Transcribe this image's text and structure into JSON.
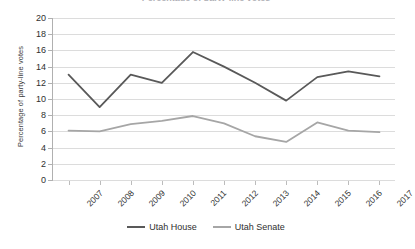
{
  "chart_data": {
    "type": "line",
    "title": "",
    "xlabel": "",
    "ylabel": "Percentage of party-line votes",
    "categories": [
      "2007",
      "2008",
      "2009",
      "2010",
      "2011",
      "2012",
      "2013",
      "2014",
      "2015",
      "2016",
      "2017"
    ],
    "ylim": [
      0,
      20
    ],
    "ytick_step": 2,
    "yticks": [
      "20",
      "18",
      "16",
      "14",
      "12",
      "10",
      "8",
      "6",
      "4",
      "2",
      "0"
    ],
    "grid": true,
    "legend_position": "bottom",
    "series": [
      {
        "name": "Utah House",
        "color": "#595959",
        "values": [
          13.0,
          9.0,
          13.0,
          12.0,
          15.8,
          14.0,
          12.0,
          9.8,
          12.7,
          13.4,
          12.8
        ]
      },
      {
        "name": "Utah Senate",
        "color": "#a6a6a6",
        "values": [
          6.1,
          6.0,
          6.9,
          7.3,
          7.9,
          7.0,
          5.4,
          4.7,
          7.1,
          6.1,
          5.9
        ]
      }
    ]
  },
  "title_remnant": "Percentage of party-line votes",
  "legend": {
    "items": [
      {
        "label": "Utah House",
        "color": "#595959"
      },
      {
        "label": "Utah Senate",
        "color": "#a6a6a6"
      }
    ]
  }
}
